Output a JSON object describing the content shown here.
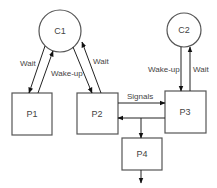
{
  "diagram": {
    "nodes": {
      "c1": {
        "label": "C1",
        "shape": "circle"
      },
      "c2": {
        "label": "C2",
        "shape": "circle"
      },
      "p1": {
        "label": "P1",
        "shape": "rect"
      },
      "p2": {
        "label": "P2",
        "shape": "rect"
      },
      "p3": {
        "label": "P3",
        "shape": "rect"
      },
      "p4": {
        "label": "P4",
        "shape": "rect"
      }
    },
    "edges": {
      "c1_p1_wait": {
        "label": "Wait",
        "from": "C1",
        "to": "P1"
      },
      "p1_c1_wakeup": {
        "label": "Wake-up",
        "from": "P1",
        "to": "C1"
      },
      "c1_p2": {
        "label": "",
        "from": "C1",
        "to": "P2"
      },
      "p2_c1_wait": {
        "label": "Wait",
        "from": "P2",
        "to": "C1"
      },
      "c2_p3_wakeup": {
        "label": "Wake-up",
        "from": "C2",
        "to": "P3"
      },
      "p3_c2_wait": {
        "label": "Wait",
        "from": "P3",
        "to": "C2"
      },
      "p2_p3_signals": {
        "label": "Signals",
        "from": "P2",
        "to": "P3"
      },
      "p3_p2": {
        "label": "",
        "from": "P3",
        "to": "P2"
      },
      "junction_p4": {
        "label": "",
        "from": "P3-P2 line",
        "to": "P4"
      },
      "p4_out": {
        "label": "",
        "from": "P4",
        "to": "outside"
      }
    }
  }
}
